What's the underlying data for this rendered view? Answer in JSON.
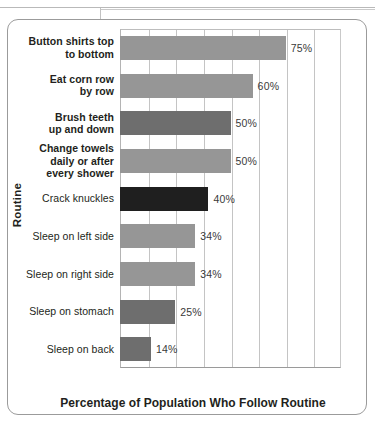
{
  "chart_data": {
    "type": "bar",
    "orientation": "horizontal",
    "title": "",
    "xlabel": "Percentage of Population Who Follow Routine",
    "ylabel": "Routine",
    "xlim": [
      0,
      100
    ],
    "grid": true,
    "grid_interval": 12.5,
    "legend": "none",
    "value_suffix": "%",
    "categories": [
      "Button shirts top to bottom",
      "Eat corn row by row",
      "Brush teeth up and down",
      "Change towels daily or after every shower",
      "Crack knuckles",
      "Sleep on left side",
      "Sleep on right side",
      "Sleep on stomach",
      "Sleep on back"
    ],
    "values": [
      75,
      60,
      50,
      50,
      40,
      34,
      34,
      25,
      14
    ],
    "data_labels": [
      "75%",
      "60%",
      "50%",
      "50%",
      "40%",
      "34%",
      "34%",
      "25%",
      "14%"
    ],
    "bar_colors": [
      "#969696",
      "#969696",
      "#6e6e6e",
      "#969696",
      "#1f1f1f",
      "#969696",
      "#969696",
      "#6e6e6e",
      "#6e6e6e"
    ],
    "bars": [
      {
        "label_lines": [
          "Button shirts top",
          "to bottom"
        ],
        "value": 75,
        "data_label": "75%",
        "color": "#969696",
        "bold": true
      },
      {
        "label_lines": [
          "Eat corn row",
          "by row"
        ],
        "value": 60,
        "data_label": "60%",
        "color": "#969696",
        "bold": true
      },
      {
        "label_lines": [
          "Brush teeth",
          "up and down"
        ],
        "value": 50,
        "data_label": "50%",
        "color": "#6e6e6e",
        "bold": true
      },
      {
        "label_lines": [
          "Change towels",
          "daily or after",
          "every shower"
        ],
        "value": 50,
        "data_label": "50%",
        "color": "#969696",
        "bold": true
      },
      {
        "label_lines": [
          "Crack knuckles"
        ],
        "value": 40,
        "data_label": "40%",
        "color": "#1f1f1f",
        "bold": false
      },
      {
        "label_lines": [
          "Sleep on left side"
        ],
        "value": 34,
        "data_label": "34%",
        "color": "#969696",
        "bold": false
      },
      {
        "label_lines": [
          "Sleep on right side"
        ],
        "value": 34,
        "data_label": "34%",
        "color": "#969696",
        "bold": false
      },
      {
        "label_lines": [
          "Sleep on stomach"
        ],
        "value": 25,
        "data_label": "25%",
        "color": "#6e6e6e",
        "bold": false
      },
      {
        "label_lines": [
          "Sleep on back"
        ],
        "value": 14,
        "data_label": "14%",
        "color": "#6e6e6e",
        "bold": false
      }
    ]
  },
  "axes": {
    "y_title": "Routine",
    "x_title": "Percentage of Population Who Follow Routine"
  },
  "colors": {
    "bar_light": "#969696",
    "bar_mid": "#6e6e6e",
    "bar_dark": "#1f1f1f",
    "grid": "#c4c4c4",
    "text": "#231f20",
    "frame": "#9b9b9b"
  }
}
